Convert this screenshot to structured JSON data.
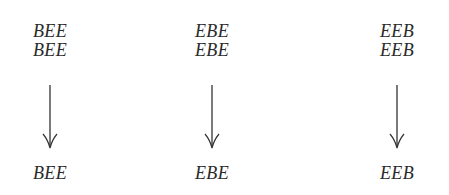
{
  "diagram": {
    "columns": [
      {
        "id": "col-bee",
        "inputs": [
          "BEE",
          "BEE"
        ],
        "output": "BEE",
        "arrow": "down"
      },
      {
        "id": "col-ebe",
        "inputs": [
          "EBE",
          "EBE"
        ],
        "output": "EBE",
        "arrow": "down"
      },
      {
        "id": "col-eeb",
        "inputs": [
          "EEB",
          "EEB"
        ],
        "output": "EEB",
        "arrow": "down"
      }
    ],
    "colors": {
      "text": "#2a2a2a",
      "arrow": "#333333",
      "background": "#ffffff"
    }
  }
}
